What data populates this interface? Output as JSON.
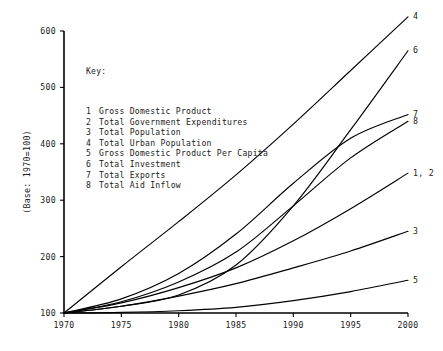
{
  "chart_data": {
    "type": "line",
    "title": "",
    "xlabel": "",
    "ylabel": "(Base:  1970=100)",
    "xlim": [
      1970,
      2000
    ],
    "ylim": [
      100,
      600
    ],
    "grid": false,
    "legend_position": "inside-upper-left",
    "x_ticks": [
      "1970",
      "1975",
      "1980",
      "1985",
      "1990",
      "1995",
      "2000"
    ],
    "y_ticks": [
      "100",
      "200",
      "300",
      "400",
      "500",
      "600"
    ],
    "x": [
      1970,
      1975,
      1980,
      1985,
      1990,
      1995,
      2000
    ],
    "series": [
      {
        "id": "4",
        "name": "Total Urban Population",
        "end_label": "4",
        "values": [
          100,
          182,
          262,
          345,
          435,
          530,
          625
        ]
      },
      {
        "id": "6",
        "name": "Total Investment",
        "end_label": "6",
        "values": [
          100,
          112,
          132,
          185,
          290,
          425,
          565
        ]
      },
      {
        "id": "7",
        "name": "Total Exports",
        "end_label": "7",
        "values": [
          100,
          125,
          170,
          240,
          330,
          410,
          452
        ]
      },
      {
        "id": "8",
        "name": "Total Aid Inflow",
        "end_label": "8",
        "values": [
          100,
          120,
          155,
          208,
          290,
          375,
          440
        ]
      },
      {
        "id": "1,2",
        "name": "Gross Domestic Product / Total Government Expenditures",
        "end_label": "1, 2",
        "values": [
          100,
          118,
          145,
          180,
          228,
          285,
          348
        ]
      },
      {
        "id": "3",
        "name": "Total Population",
        "end_label": "3",
        "values": [
          100,
          112,
          130,
          152,
          180,
          210,
          245
        ]
      },
      {
        "id": "5",
        "name": "Gross Domestic Product Per Capita",
        "end_label": "5",
        "values": [
          100,
          101,
          104,
          110,
          122,
          138,
          158
        ]
      }
    ],
    "key": {
      "title": "Key:",
      "entries": [
        {
          "num": "1",
          "label": "Gross Domestic Product"
        },
        {
          "num": "2",
          "label": "Total Government Expenditures"
        },
        {
          "num": "3",
          "label": "Total Population"
        },
        {
          "num": "4",
          "label": "Total Urban Population"
        },
        {
          "num": "5",
          "label": "Gross Domestic Product Per Capita"
        },
        {
          "num": "6",
          "label": "Total Investment"
        },
        {
          "num": "7",
          "label": "Total Exports"
        },
        {
          "num": "8",
          "label": "Total Aid Inflow"
        }
      ]
    }
  },
  "colors": {
    "line": "#000000",
    "text": "#1a1a1a",
    "background": "#ffffff"
  }
}
